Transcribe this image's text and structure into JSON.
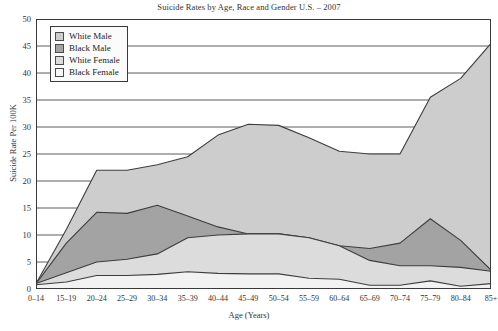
{
  "chart_data": {
    "type": "area",
    "title": "Suicide Rates by Age, Race and Gender U.S. – 2007",
    "xlabel": "Age (Years)",
    "ylabel": "Suicide Rate Per 100K",
    "grid": true,
    "legend_position": "top-left",
    "ylim": [
      0,
      50
    ],
    "yticks": [
      0,
      5,
      10,
      15,
      20,
      25,
      30,
      35,
      40,
      45,
      50
    ],
    "categories": [
      "0–14",
      "15–19",
      "20–24",
      "25–29",
      "30–34",
      "35–39",
      "40–44",
      "45–49",
      "50–54",
      "55–59",
      "60–64",
      "65–69",
      "70–74",
      "75–79",
      "80–84",
      "85+"
    ],
    "series": [
      {
        "name": "White Male",
        "color": "#cdcdcd",
        "line_color": "#3d3d3d",
        "values": [
          1.0,
          11.0,
          22.0,
          22.0,
          23.0,
          24.5,
          28.5,
          30.5,
          30.3,
          28.0,
          25.5,
          25.0,
          25.0,
          35.5,
          39.0,
          45.5
        ]
      },
      {
        "name": "Black Male",
        "color": "#a3a3a3",
        "line_color": "#3d3d3d",
        "values": [
          1.0,
          8.5,
          14.2,
          14.0,
          15.5,
          13.5,
          11.5,
          10.2,
          10.2,
          9.5,
          8.0,
          7.5,
          8.5,
          13.0,
          9.0,
          3.5
        ]
      },
      {
        "name": "White Female",
        "color": "#dcdcdc",
        "line_color": "#3d3d3d",
        "values": [
          1.0,
          3.0,
          5.0,
          5.5,
          6.5,
          9.5,
          10.0,
          10.2,
          10.2,
          9.5,
          8.0,
          5.3,
          4.3,
          4.3,
          4.0,
          3.3
        ]
      },
      {
        "name": "Black Female",
        "color": "#f2f2f2",
        "line_color": "#3d3d3d",
        "values": [
          0.8,
          1.3,
          2.5,
          2.5,
          2.7,
          3.2,
          2.9,
          2.8,
          2.8,
          2.0,
          1.8,
          0.7,
          0.7,
          1.5,
          0.5,
          1.0
        ]
      }
    ]
  },
  "legend": {
    "items": [
      {
        "label": "White Male",
        "swatch": "#cdcdcd"
      },
      {
        "label": "Black Male",
        "swatch": "#a3a3a3"
      },
      {
        "label": "White Female",
        "swatch": "#dcdcdc"
      },
      {
        "label": "Black Female",
        "swatch": "#f6f6f6"
      }
    ]
  }
}
